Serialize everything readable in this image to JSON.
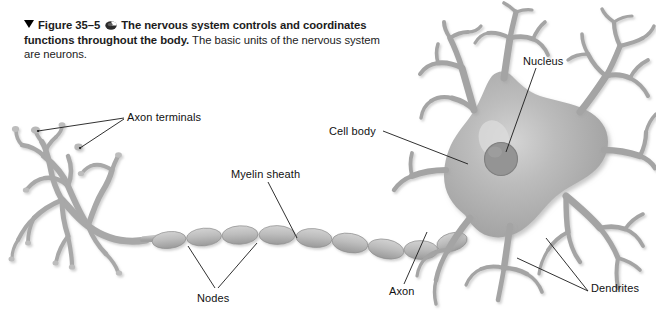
{
  "figure": {
    "marker_icon": "filled-triangle-down-icon",
    "number": "Figure 35–5",
    "media_icon": "media-disc-icon",
    "caption_bold": "The nervous system controls and coordinates functions throughout the body.",
    "caption_regular": "The basic units of the nervous system are neurons."
  },
  "labels": {
    "axon_terminals": "Axon terminals",
    "myelin_sheath": "Myelin sheath",
    "nodes": "Nodes",
    "cell_body": "Cell body",
    "nucleus": "Nucleus",
    "axon": "Axon",
    "dendrites": "Dendrites"
  },
  "colors": {
    "background": "#ffffff",
    "cell_body_fill": "#a6a6a6",
    "cell_body_highlight": "#cfcfcf",
    "nucleus_fill": "#8d8d8d",
    "dendrite_stroke": "#a2a2a2",
    "axon_stroke": "#b0b0b0",
    "myelin_fill": "#b5b5b5",
    "leader_line": "#1a1a1a",
    "text": "#111111",
    "shadow": "#d8d8d8"
  },
  "diagram": {
    "type": "labeled-anatomical-illustration",
    "subject": "neuron",
    "parts": [
      "axon terminals",
      "myelin sheath",
      "nodes",
      "axon",
      "cell body",
      "nucleus",
      "dendrites"
    ],
    "myelin_segment_count": 9
  }
}
